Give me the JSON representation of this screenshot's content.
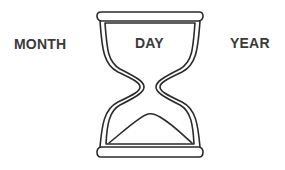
{
  "labels": {
    "left": "MONTH",
    "center": "DAY",
    "right": "YEAR"
  },
  "icon": "hourglass-icon",
  "colors": {
    "stroke": "#2b2b2b",
    "text": "#3a3a3a",
    "background": "#ffffff"
  }
}
